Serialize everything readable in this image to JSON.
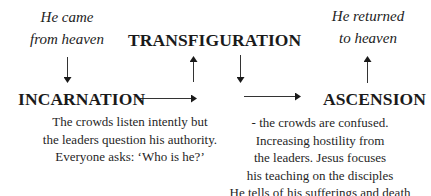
{
  "diagram": {
    "notes": {
      "came_from_heaven": [
        "He came",
        "from heaven"
      ],
      "returned_to_heaven": [
        "He returned",
        "to heaven"
      ]
    },
    "stages": {
      "incarnation": "INCARNATION",
      "transfiguration": "TRANSFIGURATION",
      "ascension": "ASCENSION"
    },
    "descriptions": {
      "before_transfiguration": [
        "The crowds listen intently but",
        "the leaders question his authority.",
        "Everyone asks: ‘Who is he?’"
      ],
      "after_transfiguration": [
        "- the crowds are confused.",
        "Increasing hostility from",
        "the leaders. Jesus focuses",
        "his teaching on the disciples",
        "He tells of his sufferings and death"
      ]
    },
    "arrows": [
      {
        "name": "heaven-to-incarnation",
        "direction": "down"
      },
      {
        "name": "incarnation-to-transfiguration",
        "direction": "right"
      },
      {
        "name": "up-to-transfiguration",
        "direction": "up"
      },
      {
        "name": "down-from-transfiguration",
        "direction": "down"
      },
      {
        "name": "to-ascension",
        "direction": "right"
      },
      {
        "name": "ascension-to-heaven",
        "direction": "up"
      }
    ]
  }
}
